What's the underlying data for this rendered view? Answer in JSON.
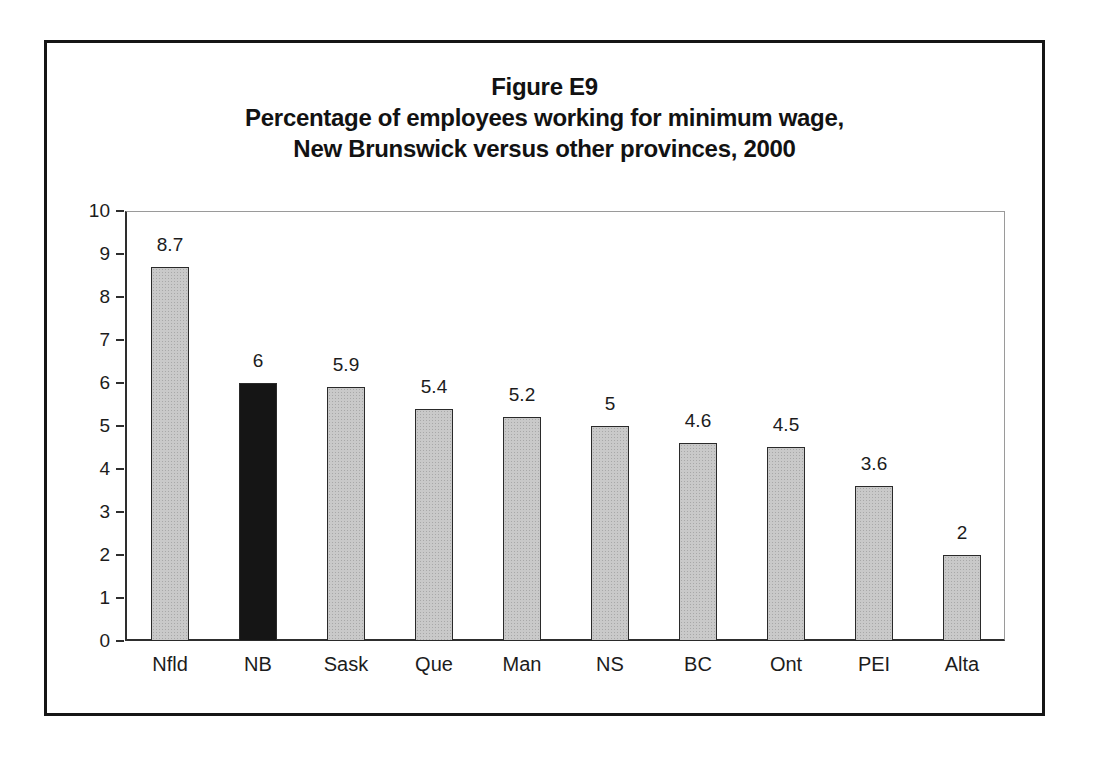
{
  "figure": {
    "title_line1": "Figure E9",
    "title_line2": "Percentage of employees working for minimum wage,",
    "title_line3": "New Brunswick versus other provinces, 2000"
  },
  "chart_data": {
    "type": "bar",
    "title": "Figure E9",
    "subtitle": "Percentage of employees working for minimum wage, New Brunswick versus other provinces, 2000",
    "categories": [
      "Nfld",
      "NB",
      "Sask",
      "Que",
      "Man",
      "NS",
      "BC",
      "Ont",
      "PEI",
      "Alta"
    ],
    "values": [
      8.7,
      6,
      5.9,
      5.4,
      5.2,
      5,
      4.6,
      4.5,
      3.6,
      2
    ],
    "value_labels": [
      "8.7",
      "6",
      "5.9",
      "5.4",
      "5.2",
      "5",
      "4.6",
      "4.5",
      "3.6",
      "2"
    ],
    "highlight_category": "NB",
    "xlabel": "",
    "ylabel": "",
    "ylim": [
      0,
      10
    ],
    "yticks": [
      0,
      1,
      2,
      3,
      4,
      5,
      6,
      7,
      8,
      9,
      10
    ],
    "grid": false,
    "legend": "none",
    "bar_color": "#c9c9c9",
    "highlight_color": "#151515",
    "frame_color": "#161616",
    "axis_color": "#2e2e2e"
  }
}
